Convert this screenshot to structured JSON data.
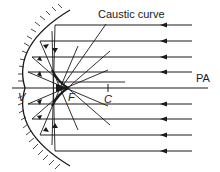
{
  "diagram": {
    "labels": {
      "caustic": "Caustic curve",
      "axis": "PA",
      "vertex": "V",
      "focus": "F",
      "center": "C"
    },
    "colors": {
      "ink": "#1a1a1a",
      "background": "#ffffff"
    },
    "incident_rays_y": [
      25,
      41,
      57,
      72,
      104,
      119,
      135,
      151
    ],
    "principal_axis_y": 88
  }
}
